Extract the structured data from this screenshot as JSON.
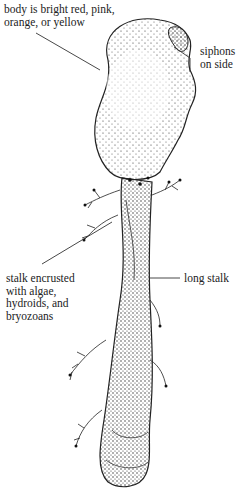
{
  "figure": {
    "labels": {
      "body": [
        "body is bright red, pink,",
        "orange, or yellow"
      ],
      "siphons": [
        "siphons",
        "on side"
      ],
      "stalk_encrusted": [
        "stalk encrusted",
        "with algae,",
        "hydroids, and",
        "bryozoans"
      ],
      "long_stalk": [
        "long stalk"
      ]
    }
  }
}
